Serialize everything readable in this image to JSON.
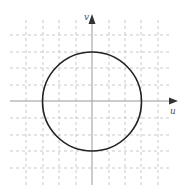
{
  "diagram": {
    "type": "coordinate-plane-circle",
    "axes": {
      "x_label": "u",
      "y_label": "v"
    },
    "grid": {
      "min": -4,
      "max": 4,
      "step": 1,
      "style": "dashed"
    },
    "circle": {
      "center": [
        0,
        0
      ],
      "radius": 3
    },
    "colors": {
      "grid": "#bbbbbb",
      "axis": "#999999",
      "circle": "#222222",
      "arrow": "#333333"
    }
  }
}
